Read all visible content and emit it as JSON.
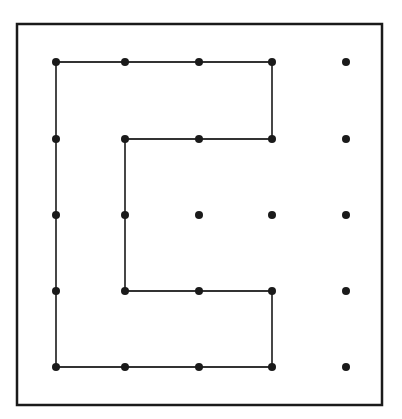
{
  "diagram": {
    "type": "dot-grid-path",
    "frame": {
      "x1": 17,
      "y1": 24,
      "x2": 382,
      "y2": 405,
      "color": "#1a1a1a"
    },
    "grid": {
      "columns": [
        56,
        125,
        199,
        272,
        346
      ],
      "rows": [
        62,
        139,
        215,
        291,
        367
      ],
      "dot_radius": 4,
      "dot_color": "#1a1a1a"
    },
    "path": {
      "description": "Closed C-shaped outline through grid points",
      "points": [
        [
          0,
          0
        ],
        [
          3,
          0
        ],
        [
          3,
          1
        ],
        [
          1,
          1
        ],
        [
          1,
          3
        ],
        [
          3,
          3
        ],
        [
          3,
          4
        ],
        [
          0,
          4
        ]
      ],
      "closed": true,
      "stroke": "#333333"
    }
  }
}
